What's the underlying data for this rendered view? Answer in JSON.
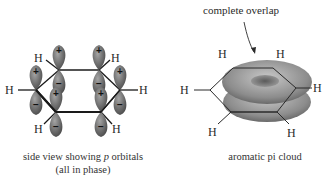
{
  "left_panel": {
    "caption_line1": "side view showing p orbitals",
    "caption_line2": "(all in phase)",
    "caption_prefix": "side view showing ",
    "caption_italic": "p",
    "caption_suffix": " orbitals",
    "atoms": [
      "H",
      "H",
      "H",
      "H",
      "H",
      "H"
    ],
    "upper_lobe_sign": "+",
    "lower_lobe_sign": "−",
    "lobe_color": "#6e6e6e"
  },
  "right_panel": {
    "annotation": "complete overlap",
    "caption": "aromatic pi cloud",
    "atoms": [
      "H",
      "H",
      "H",
      "H",
      "H",
      "H"
    ],
    "cloud_color": "#8c8c8c"
  }
}
